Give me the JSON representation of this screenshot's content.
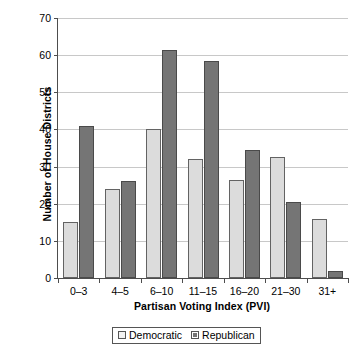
{
  "chart_data": {
    "type": "bar",
    "title": "",
    "xlabel": "Partisan Voting Index (PVI)",
    "ylabel": "Number of House Districts",
    "categories": [
      "0–3",
      "4–5",
      "6–10",
      "11–15",
      "16–20",
      "21–30",
      "31+"
    ],
    "series": [
      {
        "name": "Democratic",
        "color": "#dcdcdc",
        "values": [
          15,
          24,
          40,
          32,
          26.5,
          32.5,
          16
        ]
      },
      {
        "name": "Republican",
        "color": "#757575",
        "values": [
          41,
          26,
          61.5,
          58.5,
          34.5,
          20.5,
          2
        ]
      }
    ],
    "ylim": [
      0,
      70
    ],
    "ytick_values": [
      0,
      10,
      20,
      30,
      40,
      50,
      60,
      70
    ],
    "ytick_labels": [
      "0",
      "10",
      "20",
      "30",
      "40",
      "50",
      "60",
      "70"
    ],
    "grid": true,
    "legend_position": "bottom-center"
  },
  "legend": {
    "items": [
      {
        "label": "Democratic",
        "swatch": "democratic-swatch"
      },
      {
        "label": "Republican",
        "swatch": "republican-swatch"
      }
    ]
  }
}
